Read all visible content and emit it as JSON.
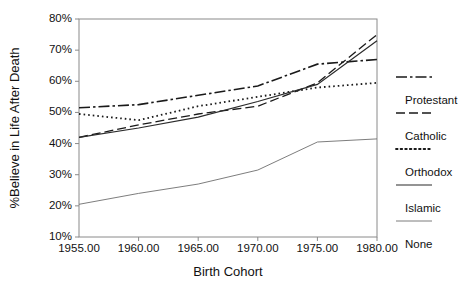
{
  "chart_data": {
    "type": "line",
    "title": "",
    "xlabel": "Birth Cohort",
    "ylabel": "%Believe in Life After Death",
    "xlim": [
      1955,
      1980
    ],
    "ylim": [
      10,
      80
    ],
    "grid": false,
    "legend_position": "right",
    "x": [
      1955,
      1960,
      1965,
      1970,
      1975,
      1980
    ],
    "xtick_labels": [
      "1955.00",
      "1960.00",
      "1965.00",
      "1970.00",
      "1975.00",
      "1980.00"
    ],
    "ytick_labels": [
      "10%",
      "20%",
      "30%",
      "40%",
      "50%",
      "60%",
      "70%",
      "80%"
    ],
    "ytick_values": [
      10,
      20,
      30,
      40,
      50,
      60,
      70,
      80
    ],
    "series": [
      {
        "name": "Protestant",
        "style": "dash-dot",
        "color": "#1a1a1a",
        "width": 1.6,
        "values": [
          51.5,
          52.5,
          55.5,
          58.5,
          65.5,
          67.0
        ]
      },
      {
        "name": "Catholic",
        "style": "dashed",
        "color": "#1a1a1a",
        "width": 1.3,
        "values": [
          42.0,
          46.0,
          49.5,
          52.0,
          59.5,
          75.0
        ]
      },
      {
        "name": "Orthodox",
        "style": "dotted",
        "color": "#1a1a1a",
        "width": 1.8,
        "values": [
          49.5,
          47.5,
          52.0,
          55.0,
          58.0,
          59.5
        ]
      },
      {
        "name": "Islamic",
        "style": "solid",
        "color": "#2b2b2b",
        "width": 1.2,
        "values": [
          42.0,
          45.0,
          48.5,
          53.5,
          59.0,
          73.0
        ]
      },
      {
        "name": "None",
        "style": "solid-thin",
        "color": "#6e6e6e",
        "width": 0.9,
        "values": [
          20.5,
          24.0,
          27.0,
          31.5,
          40.5,
          41.5
        ]
      }
    ]
  },
  "legend": {
    "entries": [
      {
        "label": "Protestant"
      },
      {
        "label": "Catholic"
      },
      {
        "label": "Orthodox"
      },
      {
        "label": "Islamic"
      },
      {
        "label": "None"
      }
    ]
  }
}
